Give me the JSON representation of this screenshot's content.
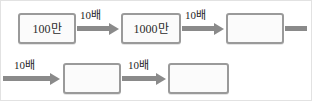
{
  "diagram": {
    "type": "flow-chain",
    "colors": {
      "box_border": "#9a9a9a",
      "box_fill": "#fbfbfb",
      "arrow": "#8a8a8a",
      "text": "#2b2b2b",
      "frame": "#e2e2e2",
      "background": "#ffffff"
    },
    "rows": [
      {
        "id": "row-1",
        "nodes": [
          {
            "id": "node-1",
            "label": "100만",
            "filled": true
          },
          {
            "id": "node-2",
            "label": "1000만",
            "filled": true
          },
          {
            "id": "node-3",
            "label": "",
            "filled": false
          }
        ],
        "connectors": [
          {
            "id": "connector-1",
            "label": "10배",
            "kind": "arrow"
          },
          {
            "id": "connector-2",
            "label": "10배",
            "kind": "arrow"
          },
          {
            "id": "connector-3",
            "label": "",
            "kind": "stub"
          }
        ]
      },
      {
        "id": "row-2",
        "nodes": [
          {
            "id": "node-4",
            "label": "",
            "filled": false
          },
          {
            "id": "node-5",
            "label": "",
            "filled": false
          }
        ],
        "connectors": [
          {
            "id": "connector-4",
            "label": "10배",
            "kind": "arrow"
          },
          {
            "id": "connector-5",
            "label": "10배",
            "kind": "arrow"
          }
        ]
      }
    ]
  }
}
